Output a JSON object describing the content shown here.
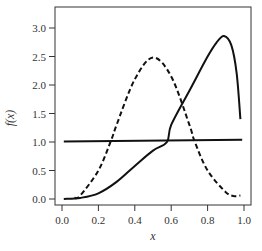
{
  "chart_data": {
    "type": "line",
    "title": "",
    "xlabel": "x",
    "ylabel": "f(x)",
    "xlim": [
      0.0,
      1.0
    ],
    "ylim": [
      0.0,
      3.0
    ],
    "grid": false,
    "legend": null,
    "x_ticks": [
      "0.0",
      "0.2",
      "0.4",
      "0.6",
      "0.8",
      "1.0"
    ],
    "y_ticks": [
      "0.0",
      "0.5",
      "1.0",
      "1.5",
      "2.0",
      "2.5",
      "3.0"
    ],
    "series": [
      {
        "name": "solid-curve",
        "style": "solid",
        "points": [
          [
            0.01,
            0.0
          ],
          [
            0.1,
            0.02
          ],
          [
            0.2,
            0.1
          ],
          [
            0.3,
            0.3
          ],
          [
            0.4,
            0.58
          ],
          [
            0.5,
            0.85
          ],
          [
            0.577,
            1.0
          ],
          [
            0.6,
            1.3
          ],
          [
            0.7,
            1.9
          ],
          [
            0.8,
            2.5
          ],
          [
            0.85,
            2.75
          ],
          [
            0.89,
            2.86
          ],
          [
            0.93,
            2.7
          ],
          [
            0.96,
            2.2
          ],
          [
            0.98,
            1.4
          ]
        ]
      },
      {
        "name": "dashed-curve",
        "style": "dashed",
        "points": [
          [
            0.07,
            0.02
          ],
          [
            0.1,
            0.06
          ],
          [
            0.2,
            0.5
          ],
          [
            0.27,
            1.03
          ],
          [
            0.3,
            1.3
          ],
          [
            0.4,
            2.1
          ],
          [
            0.5,
            2.48
          ],
          [
            0.6,
            2.15
          ],
          [
            0.7,
            1.3
          ],
          [
            0.73,
            1.0
          ],
          [
            0.8,
            0.5
          ],
          [
            0.9,
            0.12
          ],
          [
            0.95,
            0.05
          ],
          [
            0.98,
            0.06
          ]
        ]
      },
      {
        "name": "horizontal-line",
        "style": "solid",
        "points": [
          [
            0.01,
            1.01
          ],
          [
            0.99,
            1.04
          ]
        ]
      }
    ]
  }
}
